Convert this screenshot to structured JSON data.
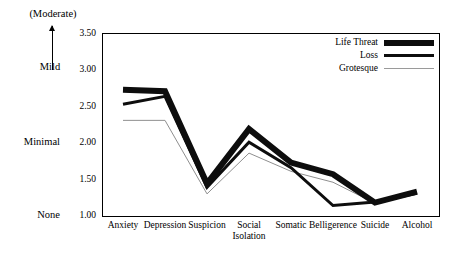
{
  "chart_data": {
    "type": "line",
    "title": "",
    "xlabel": "",
    "ylabel": "",
    "ylim": [
      1.0,
      3.5
    ],
    "yticks": [
      "1.00",
      "1.50",
      "2.00",
      "2.50",
      "3.00",
      "3.50"
    ],
    "ytick_values": [
      1.0,
      1.5,
      2.0,
      2.5,
      3.0,
      3.5
    ],
    "grid": false,
    "legend_position": "top-right",
    "categories": [
      "Anxiety",
      "Depression",
      "Suspicion",
      "Social Isolation",
      "Somatic",
      "Belligerence",
      "Suicide",
      "Alcohol"
    ],
    "category_lines": [
      [
        "Anxiety",
        ""
      ],
      [
        "Depression",
        ""
      ],
      [
        "Suspicion",
        ""
      ],
      [
        "Social",
        "Isolation"
      ],
      [
        "Somatic",
        ""
      ],
      [
        "Belligerence",
        ""
      ],
      [
        "Suicide",
        ""
      ],
      [
        "Alcohol",
        ""
      ]
    ],
    "series": [
      {
        "name": "Life Threat",
        "style": "thick-black",
        "color": "#0d0d0d",
        "width": 6,
        "values": [
          2.72,
          2.7,
          1.43,
          2.18,
          1.72,
          1.56,
          1.17,
          1.32
        ]
      },
      {
        "name": "Loss",
        "style": "medium-black",
        "color": "#0d0d0d",
        "width": 3,
        "values": [
          2.52,
          2.63,
          1.38,
          2.0,
          1.65,
          1.13,
          1.18,
          1.3
        ]
      },
      {
        "name": "Grotesque",
        "style": "thin-gray",
        "color": "#8f8f8f",
        "width": 1,
        "values": [
          2.3,
          2.3,
          1.29,
          1.85,
          1.6,
          1.45,
          1.16,
          1.3
        ]
      }
    ],
    "y_axis_annotations": [
      {
        "label": "(Moderate)",
        "value": 3.5
      },
      {
        "label": "Mild",
        "value": 3.0
      },
      {
        "label": "Minimal",
        "value": 2.0
      },
      {
        "label": "None",
        "value": 1.0
      }
    ],
    "arrow_icon": "up-arrow-icon"
  },
  "legend": {
    "items": [
      {
        "label": "Life Threat",
        "swatch": "thick-black"
      },
      {
        "label": "Loss",
        "swatch": "medium-black"
      },
      {
        "label": "Grotesque",
        "swatch": "thin-gray"
      }
    ]
  }
}
